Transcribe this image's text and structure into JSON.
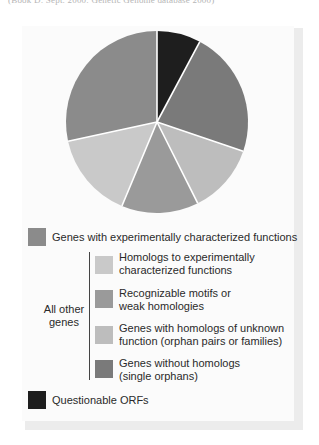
{
  "caption": "(Book D: Sept. 2000: Genetic Genome database 2000)",
  "chart_data": {
    "type": "pie",
    "title": "",
    "start": "12 o'clock",
    "direction": "clockwise",
    "slices": [
      {
        "label": "Questionable ORFs",
        "value": 7.8,
        "color": "#1e1e1e"
      },
      {
        "label": "Genes without homologs (single orphans)",
        "value": 22.4,
        "color": "#7a7a7a"
      },
      {
        "label": "Genes with homologs of unknown function (orphan pairs or families)",
        "value": 12.4,
        "color": "#bdbdbd"
      },
      {
        "label": "Recognizable motifs or weak homologies",
        "value": 13.7,
        "color": "#9a9a9a"
      },
      {
        "label": "Homologs to experimentally characterized functions",
        "value": 15.3,
        "color": "#c9c9c9"
      },
      {
        "label": "Genes with experimentally characterized functions",
        "value": 28.4,
        "color": "#8b8b8b"
      }
    ],
    "legend": {
      "placement": "bottom",
      "group_label": "All other genes",
      "entries": [
        {
          "lines": [
            "Genes with experimentally characterized functions"
          ],
          "color": "#8b8b8b",
          "grouped": false
        },
        {
          "lines": [
            "Homologs to experimentally",
            "characterized functions"
          ],
          "color": "#c9c9c9",
          "grouped": true
        },
        {
          "lines": [
            "Recognizable motifs or",
            "weak homologies"
          ],
          "color": "#9a9a9a",
          "grouped": true
        },
        {
          "lines": [
            "Genes with homologs of unknown",
            "function (orphan pairs or families)"
          ],
          "color": "#bdbdbd",
          "grouped": true
        },
        {
          "lines": [
            "Genes without homologs",
            "(single orphans)"
          ],
          "color": "#7a7a7a",
          "grouped": true
        },
        {
          "lines": [
            "Questionable ORFs"
          ],
          "color": "#1e1e1e",
          "grouped": false
        }
      ]
    }
  }
}
